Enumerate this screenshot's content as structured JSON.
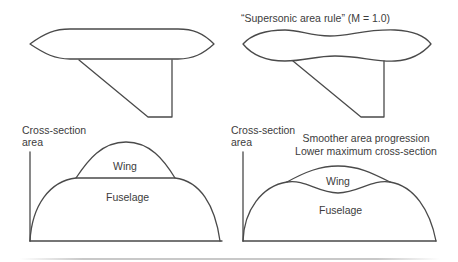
{
  "left_panel": {
    "aircraft": "conventional-fuselage-with-wing",
    "chart": {
      "y_axis_label_line1": "Cross-section",
      "y_axis_label_line2": "area",
      "regions": {
        "wing": "Wing",
        "fuselage": "Fuselage"
      }
    }
  },
  "right_panel": {
    "heading": "“Supersonic area rule” (M = 1.0)",
    "aircraft": "area-ruled-waisted-fuselage-with-wing",
    "chart": {
      "y_axis_label_line1": "Cross-section",
      "y_axis_label_line2": "area",
      "annotation_line1": "Smoother area progression",
      "annotation_line2": "Lower maximum cross-section",
      "regions": {
        "wing": "Wing",
        "fuselage": "Fuselage"
      }
    }
  },
  "colors": {
    "stroke": "#4a4a4a",
    "text": "#3c3c3c",
    "background": "#ffffff"
  }
}
